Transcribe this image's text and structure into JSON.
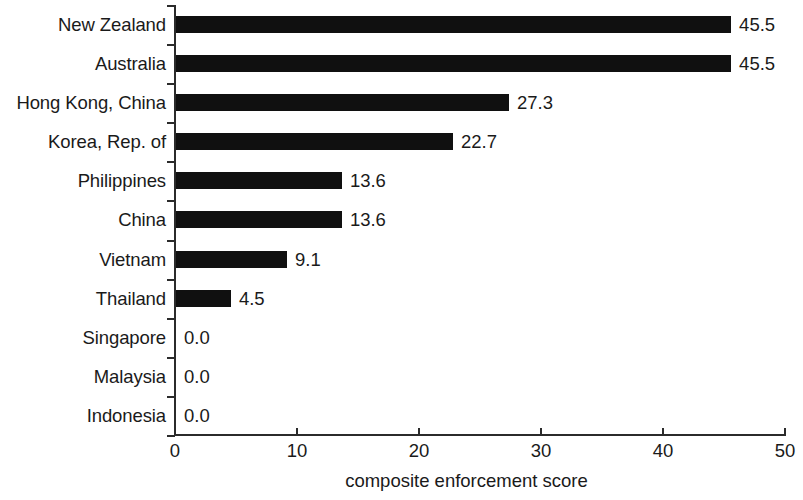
{
  "chart_data": {
    "type": "bar",
    "orientation": "horizontal",
    "title": "",
    "xlabel": "composite enforcement score",
    "ylabel": "",
    "xlim": [
      0,
      50
    ],
    "xticks": [
      "0",
      "10",
      "20",
      "30",
      "40",
      "50"
    ],
    "xtick_values": [
      0,
      10,
      20,
      30,
      40,
      50
    ],
    "grid": false,
    "legend": false,
    "bar_color": "#101010",
    "categories": [
      "New Zealand",
      "Australia",
      "Hong Kong, China",
      "Korea, Rep. of",
      "Philippines",
      "China",
      "Vietnam",
      "Thailand",
      "Singapore",
      "Malaysia",
      "Indonesia"
    ],
    "values": [
      45.5,
      45.5,
      27.3,
      22.7,
      13.6,
      13.6,
      9.1,
      4.5,
      0.0,
      0.0,
      0.0
    ],
    "value_labels": [
      "45.5",
      "45.5",
      "27.3",
      "22.7",
      "13.6",
      "13.6",
      "9.1",
      "4.5",
      "0.0",
      "0.0",
      "0.0"
    ]
  }
}
